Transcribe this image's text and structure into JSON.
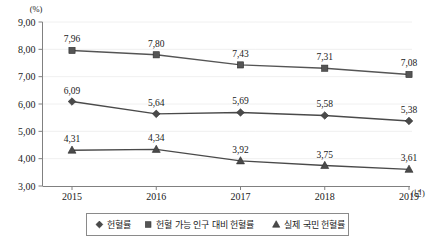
{
  "chart_data": {
    "type": "line",
    "title": "",
    "xlabel": "(년)",
    "ylabel": "(%)",
    "x": [
      "2015",
      "2016",
      "2017",
      "2018",
      "2019"
    ],
    "categories": [
      "2015",
      "2016",
      "2017",
      "2018",
      "2019"
    ],
    "ylim": [
      3.0,
      9.0
    ],
    "ytick_step": 1.0,
    "ytick_labels": [
      "9,00",
      "8,00",
      "7,00",
      "6,00",
      "5,00",
      "4,00",
      "3,00"
    ],
    "ytick_values": [
      9.0,
      8.0,
      7.0,
      6.0,
      5.0,
      4.0,
      3.0
    ],
    "grid": true,
    "legend_position": "bottom",
    "decimal_separator": ",",
    "series": [
      {
        "name": "헌혈률",
        "marker": "diamond",
        "color": "#4a4a4a",
        "values": [
          6.09,
          5.64,
          5.69,
          5.58,
          5.38
        ],
        "labels": [
          "6,09",
          "5,64",
          "5,69",
          "5,58",
          "5,38"
        ]
      },
      {
        "name": "헌혈 가능 인구 대비 헌혈률",
        "marker": "square",
        "color": "#555555",
        "values": [
          7.96,
          7.8,
          7.43,
          7.31,
          7.08
        ],
        "labels": [
          "7,96",
          "7,80",
          "7,43",
          "7,31",
          "7,08"
        ]
      },
      {
        "name": "실제 국민 헌혈률",
        "marker": "triangle",
        "color": "#4a4a4a",
        "values": [
          4.31,
          4.34,
          3.92,
          3.75,
          3.61
        ],
        "labels": [
          "4,31",
          "4,34",
          "3,92",
          "3,75",
          "3,61"
        ]
      }
    ]
  },
  "axes": {
    "y_unit": "(%)",
    "x_unit": "(년)"
  },
  "legend": {
    "items": [
      {
        "label": "헌혈률",
        "marker": "diamond-marker"
      },
      {
        "label": "헌혈 가능 인구 대비 헌혈률",
        "marker": "square-marker"
      },
      {
        "label": "실제 국민 헌혈률",
        "marker": "triangle-marker"
      }
    ]
  },
  "colors": {
    "line": "#4a4a4a",
    "grid": "#d8d8d8",
    "axis": "#808080",
    "text": "#1a1a1a",
    "legend_border": "#8a8a8a",
    "background": "#ffffff"
  }
}
